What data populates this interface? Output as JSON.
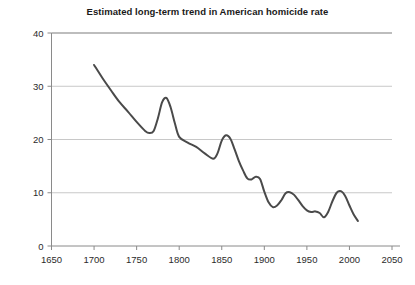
{
  "chart_data": {
    "type": "line",
    "title": "Estimated long-term trend in American homicide rate",
    "xlabel": "",
    "ylabel": "",
    "xlim": [
      1650,
      2050
    ],
    "ylim": [
      0,
      40
    ],
    "xticks": [
      1650,
      1700,
      1750,
      1800,
      1850,
      1900,
      1950,
      2000,
      2050
    ],
    "yticks": [
      0,
      10,
      20,
      30,
      40
    ],
    "grid": "horizontal",
    "legend": "none",
    "line_color": "#4a4a4a",
    "grid_color": "#c8c8c8",
    "axis_color": "#8a8a8a",
    "background": "#ffffff",
    "series": [
      {
        "name": "Estimated homicide rate",
        "x": [
          1700,
          1710,
          1720,
          1730,
          1740,
          1750,
          1760,
          1765,
          1770,
          1775,
          1780,
          1785,
          1790,
          1795,
          1800,
          1810,
          1820,
          1830,
          1840,
          1845,
          1850,
          1855,
          1860,
          1865,
          1870,
          1875,
          1880,
          1885,
          1890,
          1895,
          1900,
          1905,
          1910,
          1915,
          1920,
          1925,
          1930,
          1935,
          1940,
          1945,
          1950,
          1955,
          1960,
          1965,
          1970,
          1975,
          1980,
          1985,
          1990,
          1995,
          2000,
          2005,
          2010
        ],
        "y": [
          34.0,
          31.5,
          29.2,
          27.0,
          25.2,
          23.3,
          21.6,
          21.2,
          21.6,
          24.0,
          27.0,
          27.8,
          26.0,
          23.0,
          20.5,
          19.4,
          18.6,
          17.4,
          16.4,
          17.4,
          19.8,
          20.8,
          20.2,
          18.2,
          16.0,
          14.2,
          12.7,
          12.5,
          13.0,
          12.6,
          10.2,
          8.2,
          7.3,
          7.6,
          8.6,
          9.9,
          10.1,
          9.6,
          8.6,
          7.5,
          6.7,
          6.4,
          6.5,
          6.2,
          5.4,
          6.4,
          8.4,
          10.0,
          10.3,
          9.4,
          7.6,
          5.9,
          4.7
        ]
      }
    ]
  }
}
